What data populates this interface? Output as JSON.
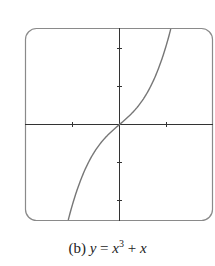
{
  "chart_data": {
    "type": "line",
    "title": "",
    "caption": "(b) y = x³ + x",
    "caption_parts": {
      "label": "(b)",
      "y": "y",
      "eq": "=",
      "x": "x",
      "exp": "3",
      "plus": "+",
      "x2": "x"
    },
    "function": "x^3 + x",
    "xlim": [
      -2,
      2
    ],
    "ylim": [
      -2.4,
      2.4
    ],
    "x_ticks": [
      -1,
      1
    ],
    "y_ticks": [
      -2,
      -1,
      1,
      2
    ],
    "xlabel": "",
    "ylabel": "",
    "grid": false,
    "series": [
      {
        "name": "y = x^3 + x",
        "x": [
          -1.1,
          -1.0,
          -0.8,
          -0.6,
          -0.4,
          -0.2,
          0,
          0.2,
          0.4,
          0.6,
          0.8,
          1.0,
          1.1
        ],
        "y": [
          -2.43,
          -2.0,
          -1.31,
          -0.82,
          -0.46,
          -0.21,
          0,
          0.21,
          0.46,
          0.82,
          1.31,
          2.0,
          2.43
        ]
      }
    ],
    "colors": {
      "frame": "#8a8a8a",
      "axes": "#333333",
      "curve": "#777777"
    }
  }
}
